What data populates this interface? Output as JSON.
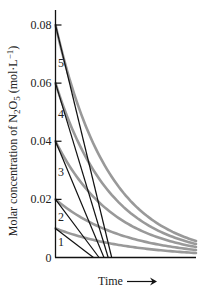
{
  "chart_data": {
    "type": "line",
    "title": "",
    "xlabel": "Time",
    "ylabel": "Molar concentration of N2O5 (mol·L⁻¹)",
    "ylabel_parts": {
      "prefix": "Molar concentration of N",
      "sub1": "2",
      "mid": "O",
      "sub2": "5",
      "suffix": " (mol·L",
      "sup": "−1",
      "end": ")"
    },
    "ylim": [
      0,
      0.08
    ],
    "yticks": [
      {
        "value": 0,
        "label": "0"
      },
      {
        "value": 0.02,
        "label": "0.02"
      },
      {
        "value": 0.04,
        "label": "0.04"
      },
      {
        "value": 0.06,
        "label": "0.06"
      },
      {
        "value": 0.08,
        "label": "0.08"
      }
    ],
    "x_ticks_shown": false,
    "grid": false,
    "legend": "none (curves labeled 1–5 inline)",
    "series": [
      {
        "name": "1",
        "initial_concentration": 0.01,
        "kind": "exponential decay",
        "color": "#999999"
      },
      {
        "name": "2",
        "initial_concentration": 0.02,
        "kind": "exponential decay",
        "color": "#999999"
      },
      {
        "name": "3",
        "initial_concentration": 0.04,
        "kind": "exponential decay",
        "color": "#999999"
      },
      {
        "name": "4",
        "initial_concentration": 0.06,
        "kind": "exponential decay",
        "color": "#999999"
      },
      {
        "name": "5",
        "initial_concentration": 0.08,
        "kind": "exponential decay",
        "color": "#999999"
      }
    ],
    "tangent_lines": [
      {
        "series": "1",
        "from": [
          0,
          0.01
        ],
        "x_intercept_rel": 0.27,
        "color": "#111111"
      },
      {
        "series": "2",
        "from": [
          0,
          0.02
        ],
        "x_intercept_rel": 0.31,
        "color": "#111111"
      },
      {
        "series": "3",
        "from": [
          0,
          0.04
        ],
        "x_intercept_rel": 0.345,
        "color": "#111111"
      },
      {
        "series": "4",
        "from": [
          0,
          0.06
        ],
        "x_intercept_rel": 0.375,
        "color": "#111111"
      },
      {
        "series": "5",
        "from": [
          0,
          0.08
        ],
        "x_intercept_rel": 0.4,
        "color": "#111111"
      }
    ],
    "annotations": [
      "Time →"
    ]
  },
  "labels": {
    "time": "Time",
    "curve_labels": [
      "1",
      "2",
      "3",
      "4",
      "5"
    ]
  }
}
